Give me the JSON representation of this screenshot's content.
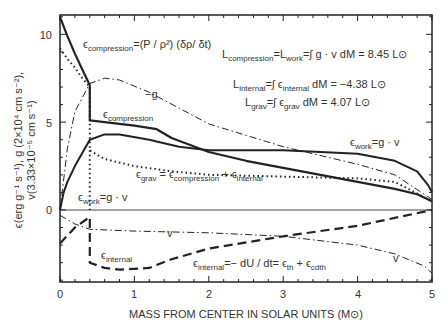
{
  "chart_data": {
    "type": "line",
    "title": "",
    "xlabel": "MASS FROM CENTER IN SOLAR UNITS (M⊙)",
    "ylabel_line1": "ϵ(erg g⁻¹ s⁻¹), g (2×10⁴ cm s⁻²),",
    "ylabel_line2": "v(3.33×10⁻⁵ cm s⁻¹)",
    "xlim": [
      0,
      5
    ],
    "ylim": [
      -4.1,
      11.1
    ],
    "x_ticks": [
      "0",
      "1",
      "2",
      "3",
      "4",
      "5"
    ],
    "y_ticks": [
      "0",
      "5",
      "10"
    ],
    "grid": false,
    "series": [
      {
        "name": "ϵ_compression",
        "style": "solid-thick",
        "x": [
          0,
          0.1,
          0.2,
          0.3,
          0.4,
          0.4,
          0.6,
          1.0,
          1.3,
          1.5,
          2.0,
          2.5,
          3.0,
          3.5,
          4.0,
          4.5,
          4.8,
          5.0
        ],
        "y": [
          11.0,
          9.9,
          8.9,
          8.0,
          7.1,
          5.1,
          5.0,
          4.8,
          4.6,
          4.1,
          3.3,
          2.8,
          2.4,
          2.0,
          1.6,
          1.2,
          0.9,
          0.5
        ]
      },
      {
        "name": "ϵ_work = g · v",
        "style": "solid",
        "x": [
          0,
          0.05,
          0.1,
          0.2,
          0.4,
          0.6,
          0.8,
          1.2,
          1.6,
          2.0,
          3.0,
          4.0,
          4.5,
          4.8,
          4.95,
          5.0
        ],
        "y": [
          0,
          1.0,
          1.6,
          2.5,
          4.0,
          4.3,
          4.3,
          4.0,
          3.6,
          3.4,
          3.4,
          3.2,
          2.8,
          2.2,
          1.4,
          1.0
        ]
      },
      {
        "name": "ϵ_grav = ϵ_compression + ϵ_internal",
        "style": "dotted",
        "x": [
          0,
          0.1,
          0.2,
          0.3,
          0.4,
          0.4,
          0.6,
          1.0,
          1.5,
          2.0,
          3.0,
          4.0,
          4.5,
          5.0
        ],
        "y": [
          9.2,
          8.6,
          8.1,
          7.5,
          7.0,
          3.4,
          2.9,
          2.5,
          2.2,
          2.0,
          1.9,
          1.8,
          1.6,
          0.5
        ]
      },
      {
        "name": "-g",
        "style": "dashdot",
        "x": [
          0,
          0.1,
          0.2,
          0.4,
          0.6,
          0.8,
          1.2,
          1.6,
          2.0,
          3.0,
          4.0,
          4.5,
          5.0
        ],
        "y": [
          0,
          3.5,
          5.6,
          7.2,
          7.5,
          7.4,
          6.7,
          5.8,
          4.9,
          3.6,
          2.6,
          2.0,
          0.6
        ]
      },
      {
        "name": "v",
        "style": "dashdot",
        "x": [
          0,
          0.2,
          0.4,
          1.0,
          2.0,
          3.0,
          4.0,
          4.5,
          4.9,
          5.0
        ],
        "y": [
          -0.3,
          -0.8,
          -1.1,
          -1.2,
          -1.3,
          -1.5,
          -2.0,
          -2.5,
          -3.2,
          -3.6
        ]
      },
      {
        "name": "ϵ_internal = -dU/dt = ϵ_th + ϵ_cdth",
        "style": "dashed",
        "x": [
          0,
          0.2,
          0.4,
          0.4,
          0.6,
          0.8,
          1.2,
          1.5,
          2.0,
          3.0,
          4.0,
          5.0
        ],
        "y": [
          -1.9,
          -1.0,
          -0.4,
          -3.0,
          -3.3,
          -3.4,
          -3.3,
          -2.8,
          -2.2,
          -1.5,
          -0.9,
          0.0
        ]
      }
    ],
    "annotations": [
      {
        "text": "ϵ_compression = (P/ρ²) (δρ/δt)"
      },
      {
        "text": "L_compression = L_work = ∫ g · v dM = 8.45 L⊙"
      },
      {
        "text": "L_internal = ∫ ϵ_internal dM = −4.38 L⊙"
      },
      {
        "text": "L_grav = ∫ ϵ_grav dM = 4.07 L⊙"
      }
    ]
  },
  "labels": {
    "eps": "ϵ",
    "compression": "compression",
    "eq_compression_rhs": "=(P / ρ²) (δρ/ δt)",
    "L": "L",
    "L_comp_mid": "=L",
    "work": "work",
    "L_comp_rhs": "=∫ g · v dM = 8.45 L⊙",
    "internal": "internal",
    "L_int_mid": "=∫ ϵ",
    "L_int_rhs": " dM = −4.38 L⊙",
    "grav": "grav",
    "L_grav_mid": "=∫ ϵ",
    "L_grav_rhs": " dM = 4.07 L⊙",
    "minus_g": "−g",
    "work_rhs": "=g · v",
    "grav_rhs_eq": " = ϵ",
    "plus_eps": " + ϵ",
    "v": "v",
    "int_rhs": "=− dU / dt=  ϵ",
    "th": "th",
    "plus": " + ϵ",
    "cdth": "cdth"
  }
}
